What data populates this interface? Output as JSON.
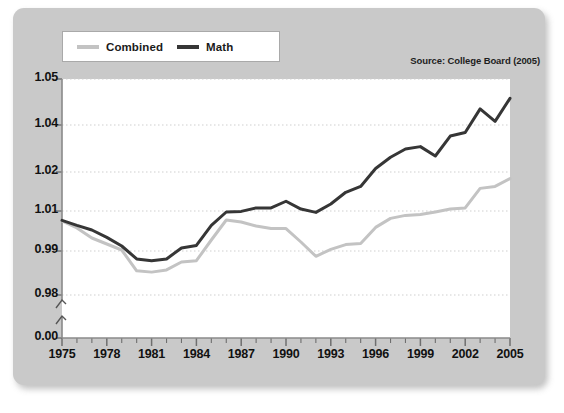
{
  "figure": {
    "source_note": "Source: College Board (2005)",
    "panel_color": "#c9c9c9",
    "plot_background": "#ffffff"
  },
  "legend": {
    "position": "top-left",
    "entries": [
      {
        "label": "Combined",
        "color": "#c3c3c3",
        "swatch_name": "combined-swatch"
      },
      {
        "label": "Math",
        "color": "#363636",
        "swatch_name": "math-swatch"
      }
    ]
  },
  "chart_data": {
    "type": "line",
    "title": "",
    "subtitle": "",
    "xlabel": "",
    "ylabel": "",
    "grid": true,
    "legend_position": "top-left",
    "axis_break": true,
    "xlim": [
      1975,
      2005
    ],
    "ylim_display": [
      0.0,
      1.05
    ],
    "y_ticks": [
      "1.05",
      "1.04",
      "1.02",
      "1.01",
      "0.99",
      "0.98",
      "0.00"
    ],
    "y_tick_values": [
      1.05,
      1.04,
      1.02,
      1.01,
      0.99,
      0.98,
      0.0
    ],
    "x_ticks": [
      "1975",
      "1978",
      "1981",
      "1984",
      "1987",
      "1990",
      "1993",
      "1996",
      "1999",
      "2002",
      "2005"
    ],
    "x_tick_values": [
      1975,
      1978,
      1981,
      1984,
      1987,
      1990,
      1993,
      1996,
      1999,
      2002,
      2005
    ],
    "x": [
      1975,
      1976,
      1977,
      1978,
      1979,
      1980,
      1981,
      1982,
      1983,
      1984,
      1985,
      1986,
      1987,
      1988,
      1989,
      1990,
      1991,
      1992,
      1993,
      1994,
      1995,
      1996,
      1997,
      1998,
      1999,
      2000,
      2001,
      2002,
      2003,
      2004,
      2005
    ],
    "series": [
      {
        "name": "Combined",
        "color": "#c3c3c3",
        "values": [
          1.005,
          1.0015,
          0.9965,
          0.9935,
          0.9905,
          0.9855,
          0.9852,
          0.9857,
          0.9875,
          0.9878,
          0.9955,
          1.0055,
          1.0045,
          1.0025,
          1.0013,
          1.0012,
          0.9945,
          0.9888,
          0.9908,
          0.9932,
          0.9938,
          1.0018,
          1.0063,
          1.0078,
          1.0082,
          1.0095,
          1.0105,
          1.0108,
          1.0158,
          1.0163,
          1.0183
        ]
      },
      {
        "name": "Math",
        "color": "#363636",
        "values": [
          1.0053,
          1.0028,
          1.0005,
          0.9968,
          0.9925,
          0.9882,
          0.9878,
          0.9882,
          0.9915,
          0.9928,
          1.0028,
          1.0095,
          1.0098,
          1.0108,
          1.0108,
          1.0125,
          1.0105,
          1.0093,
          1.0118,
          1.0148,
          1.0163,
          1.0215,
          1.0263,
          1.0298,
          1.0308,
          1.0268,
          1.0353,
          1.0368,
          1.0435,
          1.0408,
          1.0458
        ]
      }
    ]
  }
}
